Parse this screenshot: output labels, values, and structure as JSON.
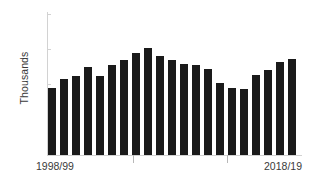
{
  "chart_data": {
    "type": "bar",
    "title": "",
    "subtitle": "",
    "xlabel": "",
    "ylabel": "Thousands",
    "ylim": [
      0,
      8
    ],
    "y_ticks": [
      2,
      4,
      6,
      8
    ],
    "grid": false,
    "legend": null,
    "bar_color": "#1a1a1a",
    "axis_color": "#d2d2d2",
    "text_color": "#3a3a3a",
    "categories": [
      "1998/99",
      "1999/00",
      "2000/01",
      "2001/02",
      "2002/03",
      "2003/04",
      "2004/05",
      "2005/06",
      "2006/07",
      "2007/08",
      "2008/09",
      "2009/10",
      "2010/11",
      "2011/12",
      "2012/13",
      "2013/14",
      "2014/15",
      "2015/16",
      "2016/17",
      "2017/18",
      "2018/19"
    ],
    "values": [
      3.73,
      4.27,
      4.43,
      4.9,
      4.43,
      5.02,
      5.29,
      5.7,
      5.98,
      5.53,
      5.34,
      5.11,
      5.04,
      4.79,
      4.04,
      3.76,
      3.68,
      4.48,
      4.73,
      5.18,
      5.37
    ],
    "x_tick_labels_visible": [
      "1998/99",
      "2018/19"
    ],
    "x_tick_marks": 2
  },
  "axis": {
    "y_title": "Thousands",
    "y_labels": [
      "8",
      "6",
      "4",
      "2"
    ],
    "x_start_label": "1998/99",
    "x_end_label": "2018/19"
  }
}
